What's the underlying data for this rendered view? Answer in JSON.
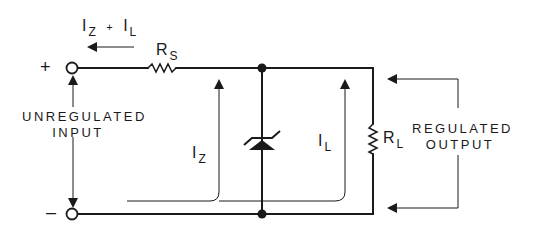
{
  "diagram": {
    "type": "zener-shunt-regulator-schematic",
    "colors": {
      "line": "#1a1a1a",
      "background": "#ffffff"
    },
    "labels": {
      "input_plus": "+",
      "input_minus": "–",
      "total_current": {
        "i1": "I",
        "i1_sub": "Z",
        "plus": "+",
        "i2": "I",
        "i2_sub": "L"
      },
      "series_resistor": {
        "main": "R",
        "sub": "S"
      },
      "zener_current": {
        "main": "I",
        "sub": "Z"
      },
      "load_current": {
        "main": "I",
        "sub": "L"
      },
      "load_resistor": {
        "main": "R",
        "sub": "L"
      },
      "input_label": {
        "line1": "UNREGULATED",
        "line2": "INPUT"
      },
      "output_label": {
        "line1": "REGULATED",
        "line2": "OUTPUT"
      }
    },
    "components": [
      {
        "id": "input-terminal-pos",
        "kind": "terminal",
        "polarity": "+"
      },
      {
        "id": "input-terminal-neg",
        "kind": "terminal",
        "polarity": "-"
      },
      {
        "id": "RS",
        "kind": "resistor",
        "label": "RS"
      },
      {
        "id": "DZ",
        "kind": "zener-diode",
        "orientation": "cathode-up"
      },
      {
        "id": "RL",
        "kind": "resistor",
        "label": "RL"
      }
    ],
    "current_arrows": [
      {
        "label": "IZ + IL",
        "direction": "left",
        "location": "above input line"
      },
      {
        "label": "IZ",
        "direction": "up",
        "path": "return line to top rail left of zener"
      },
      {
        "label": "IL",
        "direction": "up",
        "path": "return line to top rail left of RL"
      }
    ]
  }
}
